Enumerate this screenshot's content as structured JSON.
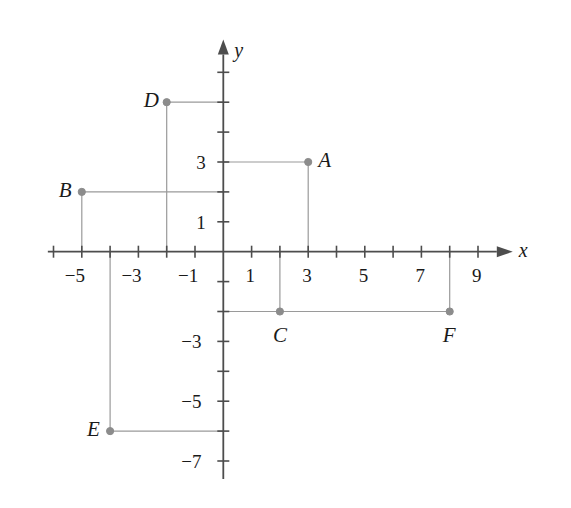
{
  "chart_data": {
    "type": "scatter",
    "title": "",
    "xlabel": "x",
    "ylabel": "y",
    "grid": false,
    "legend": "none",
    "xlim": [
      -6.2,
      10.3
    ],
    "ylim": [
      -7.6,
      7.0
    ],
    "x_tick_labels": [
      {
        "value": -5,
        "text": "−5"
      },
      {
        "value": -3,
        "text": "−3"
      },
      {
        "value": -1,
        "text": "−1"
      },
      {
        "value": 1,
        "text": "1"
      },
      {
        "value": 3,
        "text": "3"
      },
      {
        "value": 5,
        "text": "5"
      },
      {
        "value": 7,
        "text": "7"
      },
      {
        "value": 9,
        "text": "9"
      }
    ],
    "y_tick_labels": [
      {
        "value": 3,
        "text": "3"
      },
      {
        "value": 1,
        "text": "1"
      },
      {
        "value": -3,
        "text": "−3"
      },
      {
        "value": -5,
        "text": "−5"
      },
      {
        "value": -7,
        "text": "−7"
      }
    ],
    "x_ticks_all": [
      -6,
      -5,
      -4,
      -3,
      -2,
      -1,
      1,
      2,
      3,
      4,
      5,
      6,
      7,
      8,
      9
    ],
    "y_ticks_all": [
      6,
      5,
      4,
      3,
      2,
      1,
      -1,
      -2,
      -3,
      -4,
      -5,
      -6,
      -7
    ],
    "points": [
      {
        "label": "A",
        "x": 3,
        "y": 3,
        "label_pos": "right"
      },
      {
        "label": "B",
        "x": -5,
        "y": 2,
        "label_pos": "left"
      },
      {
        "label": "C",
        "x": 2,
        "y": -2,
        "label_pos": "below"
      },
      {
        "label": "D",
        "x": -2,
        "y": 5,
        "label_pos": "left"
      },
      {
        "label": "E",
        "x": -4,
        "y": -6,
        "label_pos": "left"
      },
      {
        "label": "F",
        "x": 8,
        "y": -2,
        "label_pos": "below"
      }
    ],
    "guide_lines": [
      {
        "point": "A",
        "from": [
          0,
          3
        ],
        "to": [
          3,
          3
        ],
        "orientation": "horizontal"
      },
      {
        "point": "A",
        "from": [
          3,
          3
        ],
        "to": [
          3,
          0
        ],
        "orientation": "vertical"
      },
      {
        "point": "B",
        "from": [
          -5,
          2
        ],
        "to": [
          0,
          2
        ],
        "orientation": "horizontal"
      },
      {
        "point": "B",
        "from": [
          -5,
          2
        ],
        "to": [
          -5,
          0
        ],
        "orientation": "vertical"
      },
      {
        "point": "C",
        "from": [
          0,
          -2
        ],
        "to": [
          2,
          -2
        ],
        "orientation": "horizontal"
      },
      {
        "point": "C",
        "from": [
          2,
          -2
        ],
        "to": [
          2,
          0
        ],
        "orientation": "vertical"
      },
      {
        "point": "D",
        "from": [
          -2,
          5
        ],
        "to": [
          0,
          5
        ],
        "orientation": "horizontal"
      },
      {
        "point": "D",
        "from": [
          -2,
          5
        ],
        "to": [
          -2,
          0
        ],
        "orientation": "vertical"
      },
      {
        "point": "E",
        "from": [
          -4,
          -6
        ],
        "to": [
          0,
          -6
        ],
        "orientation": "horizontal"
      },
      {
        "point": "E",
        "from": [
          -4,
          -6
        ],
        "to": [
          -4,
          0
        ],
        "orientation": "vertical"
      },
      {
        "point": "F",
        "from": [
          2,
          -2
        ],
        "to": [
          8,
          -2
        ],
        "orientation": "horizontal"
      },
      {
        "point": "F",
        "from": [
          8,
          -2
        ],
        "to": [
          8,
          0
        ],
        "orientation": "vertical"
      }
    ],
    "colors": {
      "axis": "#4d4d4d",
      "guide_line": "#9a9a9a",
      "point": "#8c8c8c",
      "text": "#1a1a1a",
      "background": "#ffffff"
    },
    "geometry": {
      "origin_px": [
        223.3,
        251.7
      ],
      "x_unit_px": 28.3,
      "y_unit_px": 29.9
    }
  }
}
